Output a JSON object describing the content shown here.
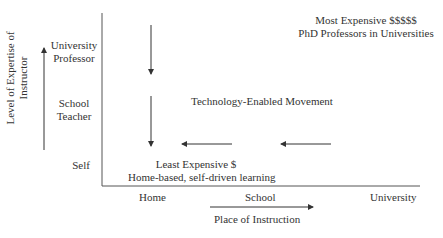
{
  "diagram": {
    "y_axis": {
      "title": "Level of Expertise of Instructor",
      "title_line1": "Level of Expertise of",
      "title_line2": "Instructor",
      "levels": [
        "University Professor",
        "School Teacher",
        "Self"
      ],
      "level_university_line1": "University",
      "level_university_line2": "Professor",
      "level_school_line1": "School",
      "level_school_line2": "Teacher",
      "level_self": "Self"
    },
    "x_axis": {
      "title": "Place of Instruction",
      "levels": [
        "Home",
        "School",
        "University"
      ]
    },
    "annotations": {
      "most_expensive": "Most Expensive $$$$$",
      "most_expensive_sub": "PhD Professors in Universities",
      "movement": "Technology-Enabled Movement",
      "least_expensive": "Least Expensive $",
      "least_expensive_sub": "Home-based, self-driven learning"
    },
    "colors": {
      "line": "#333333",
      "text": "#333333",
      "background": "#ffffff"
    }
  }
}
